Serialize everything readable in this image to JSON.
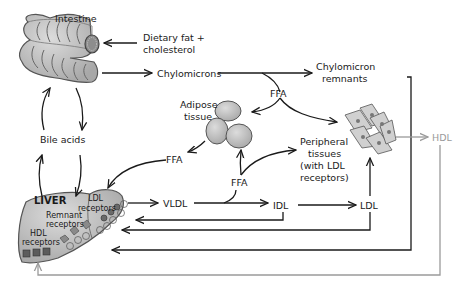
{
  "labels": {
    "intestine": "Intestine",
    "dietary_1": "Dietary fat +",
    "dietary_2": "cholesterol",
    "chylomicrons": "Chylomicrons",
    "chylo_remnants_1": "Chylomicron",
    "chylo_remnants_2": "remnants",
    "ffa_top": "FFA",
    "adipose_1": "Adipose",
    "adipose_2": "tissue",
    "bile_acids": "Bile acids",
    "ffa_left": "FFA",
    "ffa_mid": "FFA",
    "peripheral_1": "Peripheral",
    "peripheral_2": "tissues",
    "peripheral_3": "(with LDL",
    "peripheral_4": "receptors)",
    "hdl": "HDL",
    "liver": "LIVER",
    "ldl_rec_1": "LDL",
    "ldl_rec_2": "receptors",
    "remnant_rec_1": "Remnant",
    "remnant_rec_2": "receptors",
    "hdl_rec_1": "HDL",
    "hdl_rec_2": "receptors",
    "vldl": "VLDL",
    "idl": "IDL",
    "ldl": "LDL"
  },
  "colors": {
    "organ_fill": "#bdbdbd",
    "organ_stroke": "#555555",
    "arrow": "#1a1a1a",
    "hdl_path": "#9a9a9a"
  }
}
